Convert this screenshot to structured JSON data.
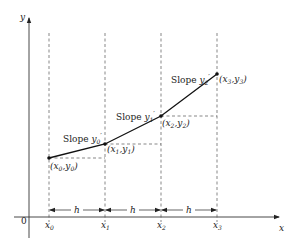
{
  "diagram": {
    "type": "piecewise-linear-slope-diagram",
    "axes": {
      "x_label": "x",
      "y_label": "y",
      "origin_label": "0"
    },
    "x_ticks": [
      {
        "base": "x",
        "sub": "0"
      },
      {
        "base": "x",
        "sub": "1"
      },
      {
        "base": "x",
        "sub": "2"
      },
      {
        "base": "x",
        "sub": "3"
      }
    ],
    "step_label": "h",
    "points": [
      {
        "label": "(x0,y0)",
        "x_base": "(x",
        "x_sub": "0",
        "mid": ",y",
        "y_sub": "0",
        "close": ")"
      },
      {
        "label": "(x1,y1)",
        "x_base": "(x",
        "x_sub": "1",
        "mid": ",y",
        "y_sub": "1",
        "close": ")"
      },
      {
        "label": "(x2,y2)",
        "x_base": "(x",
        "x_sub": "2",
        "mid": ",y",
        "y_sub": "2",
        "close": ")"
      },
      {
        "label": "(x3,y3)",
        "x_base": "(x",
        "x_sub": "3",
        "mid": ",y",
        "y_sub": "3",
        "close": ")"
      }
    ],
    "slopes": [
      {
        "prefix": "Slope ",
        "var": "y",
        "sub": "0",
        "prime": "′"
      },
      {
        "prefix": "Slope ",
        "var": "y",
        "sub": "1",
        "prime": "′"
      },
      {
        "prefix": "Slope ",
        "var": "y",
        "sub": "2",
        "prime": "′"
      }
    ],
    "colors": {
      "line": "#111111",
      "dashed": "#555555",
      "axis": "#333333"
    }
  }
}
